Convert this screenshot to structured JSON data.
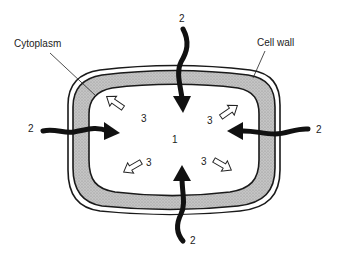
{
  "diagram": {
    "labels": {
      "cytoplasm": "Cytoplasm",
      "cell_wall": "Cell wall"
    },
    "center_marker": "1",
    "inflow_arrows": [
      {
        "id": "top",
        "label": "2"
      },
      {
        "id": "left",
        "label": "2"
      },
      {
        "id": "right",
        "label": "2"
      },
      {
        "id": "bottom",
        "label": "2"
      }
    ],
    "pressure_arrows": [
      {
        "id": "top-left",
        "label": "3"
      },
      {
        "id": "top-right",
        "label": "3"
      },
      {
        "id": "bottom-left",
        "label": "3"
      },
      {
        "id": "bottom-right",
        "label": "3"
      }
    ],
    "colors": {
      "cytoplasm_fill": "#bdbdbd",
      "outline": "#1a1a1a",
      "background": "#ffffff"
    }
  }
}
